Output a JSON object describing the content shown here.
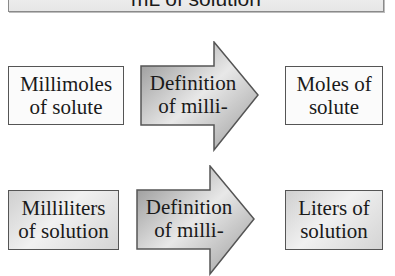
{
  "banner": {
    "label": "mL of solution"
  },
  "rows": [
    {
      "from": {
        "label": "Millimoles\nof solute",
        "style": "white"
      },
      "via": {
        "label": "Definition\nof milli-"
      },
      "to": {
        "label": "Moles of\nsolute",
        "style": "white"
      }
    },
    {
      "from": {
        "label": "Milliliters\nof solution",
        "style": "gray"
      },
      "via": {
        "label": "Definition\nof milli-"
      },
      "to": {
        "label": "Liters of\nsolution",
        "style": "gray"
      }
    }
  ],
  "colors": {
    "border": "#555555",
    "arrow_dark": "#8c8c8c",
    "arrow_light": "#ececec"
  }
}
